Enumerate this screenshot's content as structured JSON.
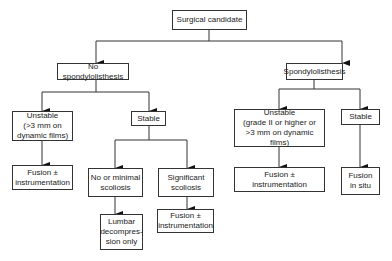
{
  "nodes": {
    "root": {
      "label": "Surgical candidate"
    },
    "no_spondy": {
      "label": "No spondylolisthesis"
    },
    "spondy": {
      "label": "Spondylolisthesis"
    },
    "left_unstable": {
      "label": "Unstable\n(>3 mm on\ndynamic films)"
    },
    "left_stable": {
      "label": "Stable"
    },
    "left_fusion": {
      "label": "Fusion ±\ninstrumentation"
    },
    "minimal_scoliosis": {
      "label": "No or minimal\nscoliosis"
    },
    "significant_scoliosis": {
      "label": "Significant\nscoliosis"
    },
    "lumbar_decompression": {
      "label": "Lumbar\ndecompres-\nsion only"
    },
    "mid_fusion": {
      "label": "Fusion ±\ninstrumentation"
    },
    "right_unstable": {
      "label": "Unstable\n(grade II or higher or\n>3 mm on dynamic films)"
    },
    "right_stable": {
      "label": "Stable"
    },
    "right_fusion": {
      "label": "Fusion ±\ninstrumentation"
    },
    "fusion_in_situ": {
      "label": "Fusion\nin situ"
    }
  }
}
